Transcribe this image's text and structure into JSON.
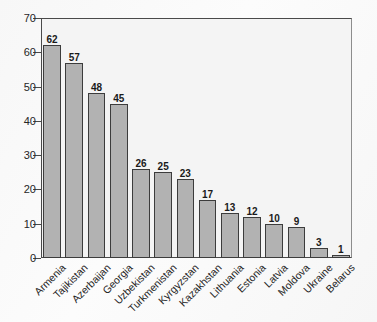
{
  "chart_data": {
    "type": "bar",
    "title": "",
    "subtitle": "",
    "xlabel": "",
    "ylabel": "",
    "ylim": [
      0,
      70
    ],
    "ytick_values": [
      0,
      10,
      20,
      30,
      40,
      50,
      60,
      70
    ],
    "ytick_labels": [
      "0",
      "10",
      "20",
      "30",
      "40",
      "50",
      "60",
      "70"
    ],
    "grid": false,
    "legend": false,
    "bar_labels_shown": true,
    "categories": [
      "Armenia",
      "Tajikistan",
      "Azerbaijan",
      "Georgia",
      "Uzbekistan",
      "Turkmenistan",
      "Kyrgyzstan",
      "Kazakhstan",
      "Lithuania",
      "Estonia",
      "Latvia",
      "Moldova",
      "Ukraine",
      "Belarus"
    ],
    "values": [
      62,
      57,
      48,
      45,
      26,
      25,
      23,
      17,
      13,
      12,
      10,
      9,
      3,
      1
    ],
    "value_labels": [
      "62",
      "57",
      "48",
      "45",
      "26",
      "25",
      "23",
      "17",
      "13",
      "12",
      "10",
      "9",
      "3",
      "1"
    ],
    "colors": {
      "bar_fill": "#b2b2b2",
      "bar_edge": "#3c3c3c",
      "axis": "#4a4a4a",
      "text": "#1f1f1f",
      "plot_background": "#f4f4f4",
      "page_background": "#fafafa"
    }
  }
}
